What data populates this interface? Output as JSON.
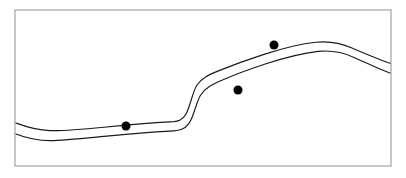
{
  "figure": {
    "background_color": "#ffffff",
    "canvas": {
      "width": 406,
      "height": 178
    }
  },
  "frame": {
    "label": "plot-border",
    "x": 15,
    "y": 10,
    "width": 376,
    "height": 156,
    "stroke_color": "#9a9a9a",
    "stroke_width": 1.1,
    "fill_color": "#ffffff"
  },
  "chart_data": {
    "type": "line",
    "title": "",
    "subtitle": "",
    "xlabel": "",
    "ylabel": "",
    "xlim": [
      15,
      391
    ],
    "ylim": [
      10,
      166
    ],
    "grid": false,
    "legend": "none",
    "axis_ticks": [],
    "stroke_color": "#1a1a1a",
    "stroke_width": 1.15,
    "series": [
      {
        "name": "upper-curve",
        "path": "M 16 123 C 24 126 34 130 50 130.6 C 64 131.2 82 129.4 104 127.2 C 128 124.8 152 122.8 170 121.9 C 178 121.5 182.5 120.4 186 114 C 190.5 105.6 192.5 92 197 85 C 201.5 78 209 74.6 219 70.6 C 232 65.4 248 59.6 264 54.4 C 282 48.6 300 44 316 42.3 C 330 40.9 341 43.2 352 48 C 366 54 379 59.6 390 63.2"
      },
      {
        "name": "lower-curve",
        "path": "M 16 134 C 24 137.2 34 140.6 50 140.6 C 64 140.6 82 138.6 104 136.4 C 128 134 152 132 170 131.1 C 179 130.6 184.5 129.8 189 123.4 C 194 116.2 196 102.6 200.5 95.2 C 205 87.8 212.5 84.2 222.5 80 C 235 74.6 250 69 266 63.8 C 284 58 302 53.2 318 51.4 C 332 50 343 52.4 354 57.4 C 368 63.6 380 69.4 390 73"
      }
    ],
    "points": [
      {
        "name": "point-left",
        "x": 126,
        "y": 126,
        "radius": 4.5,
        "color": "#000000"
      },
      {
        "name": "point-middle",
        "x": 238,
        "y": 90,
        "radius": 4.5,
        "color": "#000000"
      },
      {
        "name": "point-upper-right",
        "x": 274,
        "y": 45,
        "radius": 4.5,
        "color": "#000000"
      }
    ]
  }
}
